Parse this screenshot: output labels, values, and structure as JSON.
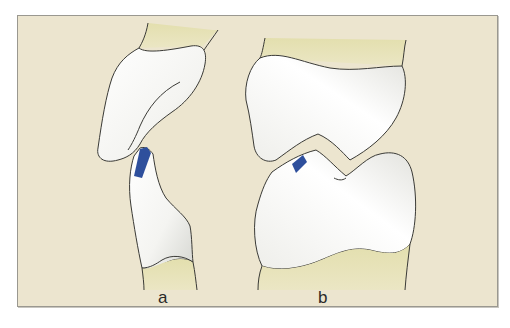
{
  "figure": {
    "panels": [
      {
        "id": "a",
        "label": "a",
        "description": "side view of joint: upper bone and narrow lower bone with blue contact mark"
      },
      {
        "id": "b",
        "label": "b",
        "description": "front view of joint: upper bone and wide lower bone with blue contact mark"
      }
    ],
    "colors": {
      "background": "#ece5cf",
      "cartilage": "#e6e3b8",
      "bone": "#ffffff",
      "bone_shade": "#dcdcd6",
      "outline": "#3a3a36",
      "contact_mark": "#2e4f9c",
      "frame_border": "#9a9890"
    }
  }
}
